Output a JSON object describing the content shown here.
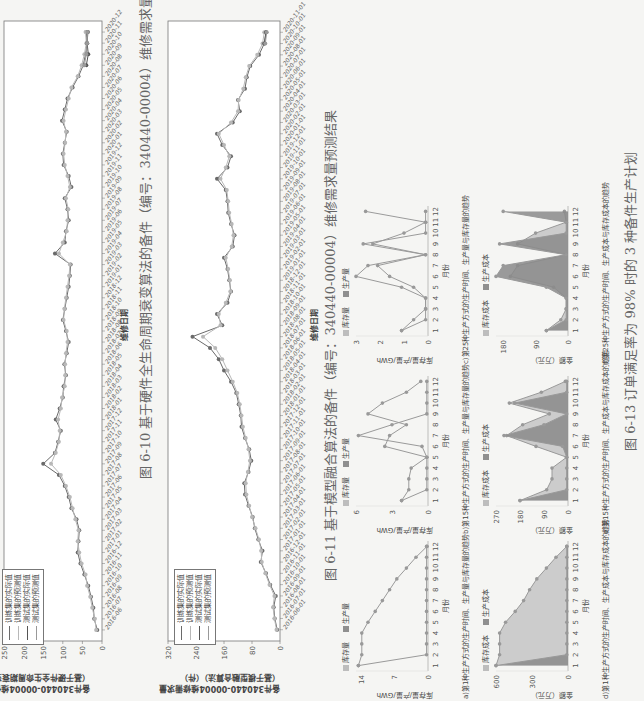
{
  "page": {
    "orientation": "rotated-90-ccw"
  },
  "figure_6_10": {
    "caption": "图 6-10   基于硬件全生命周期衰变算法的备件（编号：340440-00004）维修需求量预测结果",
    "ylabel_line1": "备件340440-00004维修需求量",
    "ylabel_line2": "（基于硬件全生命周期衰变算法）",
    "xlabel": "维修日期",
    "legend": [
      "训练集的实际值",
      "训练集的预测值",
      "测试集的实际值",
      "测试集的预测值"
    ],
    "yticks": [
      "0",
      "50",
      "100",
      "150",
      "200",
      "250"
    ]
  },
  "figure_6_11": {
    "caption": "图 6-11   基于模型融合算法的备件（编号：340440-00004）维修需求量预测结果",
    "ylabel_line1": "备件340440-00004维修需求量",
    "ylabel_line2": "（基于模型融合算法）（件）",
    "xlabel": "维修日期",
    "legend": [
      "训练集的实际值",
      "训练集的预测值",
      "测试集的实际值",
      "测试集的预测值"
    ],
    "yticks": [
      "0",
      "80",
      "160",
      "240",
      "320"
    ]
  },
  "figure_6_13": {
    "caption": "图 6-13   订单满足率为 98% 时的 3 种备件生产计划",
    "panels": [
      {
        "id": "a",
        "caption": "a)第1种生产方式的生产时间、生产量与库存量的趋势",
        "ylabel": "库存量/产量/GWh",
        "legend": [
          "库存量",
          "生产量"
        ],
        "yticks": [
          "0",
          "7",
          "14"
        ],
        "xlabel": "月份"
      },
      {
        "id": "b",
        "caption": "b)第15种生产方式的生产时间、生产量与库存量的趋势",
        "ylabel": "库存量/产量/GWh",
        "legend": [
          "库存量",
          "生产量"
        ],
        "yticks": [
          "0",
          "3",
          "6"
        ],
        "xlabel": "月份"
      },
      {
        "id": "c",
        "caption": "c)第25种生产方式的生产时间、生产量与库存量的趋势",
        "ylabel": "库存量/产量/GWh",
        "legend": [
          "库存量",
          "生产量"
        ],
        "yticks": [
          "0",
          "1",
          "2",
          "3"
        ],
        "xlabel": "月份"
      },
      {
        "id": "d",
        "caption": "d)第1种生产方式的生产时间、生产成本与库存成本的趋势",
        "ylabel": "金额（万元）",
        "legend": [
          "库存成本",
          "生产成本"
        ],
        "yticks": [
          "0",
          "300",
          "600"
        ],
        "xlabel": "月份"
      },
      {
        "id": "e",
        "caption": "e)第15种生产方式的生产时间、生产成本与库存成本的趋势",
        "ylabel": "金额（万元）",
        "legend": [
          "库存成本",
          "生产成本"
        ],
        "yticks": [
          "0",
          "90",
          "180",
          "270"
        ],
        "xlabel": "月份"
      },
      {
        "id": "f",
        "caption": "f)第25种生产方式的生产时间、生产成本与库存成本的趋势",
        "ylabel": "金额（万元）",
        "legend": [
          "库存成本",
          "生产成本"
        ],
        "yticks": [
          "0",
          "90",
          "180"
        ],
        "xlabel": "月份"
      }
    ],
    "months": [
      "1",
      "2",
      "3",
      "4",
      "5",
      "6",
      "7",
      "8",
      "9",
      "10",
      "11",
      "12"
    ]
  },
  "chart_data": [
    {
      "type": "line",
      "title": "图 6-10 基于硬件全生命周期衰变算法的备件（编号：340440-00004）维修需求量预测结果",
      "xlabel": "维修日期",
      "ylabel": "备件340440-00004维修需求量（基于硬件全生命周期衰变算法）",
      "ylim": [
        0,
        250
      ],
      "x": [
        "2016-06",
        "2016-07",
        "2016-08",
        "2016-09",
        "2016-10",
        "2016-11",
        "2016-12",
        "2017-01",
        "2017-02",
        "2017-03",
        "2017-04",
        "2017-05",
        "2017-06",
        "2017-07",
        "2017-08",
        "2017-09",
        "2017-10",
        "2017-11",
        "2017-12",
        "2018-01",
        "2018-02",
        "2018-03",
        "2018-04",
        "2018-05",
        "2018-06",
        "2018-07",
        "2018-08",
        "2018-09",
        "2018-10",
        "2018-11",
        "2018-12",
        "2019-01",
        "2019-02",
        "2019-03",
        "2019-04",
        "2019-05",
        "2019-06",
        "2019-07",
        "2019-08",
        "2019-09",
        "2019-10",
        "2019-11",
        "2019-12",
        "2020-01",
        "2020-02",
        "2020-03",
        "2020-04",
        "2020-05",
        "2020-06",
        "2020-07",
        "2020-08",
        "2020-09",
        "2020-10",
        "2020-11",
        "2020-12"
      ],
      "series": [
        {
          "name": "训练集的实际值",
          "values": [
            12,
            20,
            22,
            28,
            35,
            45,
            55,
            62,
            60,
            58,
            65,
            78,
            85,
            95,
            110,
            150,
            120,
            112,
            105,
            118,
            108,
            100,
            98,
            92,
            96,
            90,
            85,
            92,
            100,
            95,
            90,
            85,
            82,
            80,
            120,
            95,
            92,
            85,
            88,
            95,
            78,
            85,
            98,
            100,
            95,
            90,
            102,
            95,
            88,
            75,
            60,
            48,
            42,
            38,
            40
          ]
        },
        {
          "name": "训练集的预测值",
          "values": [
            15,
            18,
            25,
            30,
            38,
            42,
            52,
            58,
            62,
            60,
            68,
            75,
            82,
            92,
            105,
            130,
            118,
            110,
            108,
            112,
            105,
            102,
            95,
            94,
            94,
            92,
            88,
            90,
            98,
            96,
            92,
            88,
            84,
            82,
            110,
            100,
            90,
            88,
            86,
            92,
            82,
            88,
            95,
            98,
            94,
            92,
            98,
            92,
            85,
            78,
            62,
            52,
            45,
            40,
            42
          ]
        },
        {
          "name": "测试集的实际值",
          "values": [
            null,
            null,
            null,
            null,
            null,
            null,
            null,
            null,
            null,
            null,
            null,
            null,
            null,
            null,
            null,
            null,
            null,
            null,
            null,
            null,
            null,
            null,
            null,
            null,
            null,
            null,
            null,
            null,
            null,
            null,
            null,
            null,
            null,
            null,
            null,
            null,
            null,
            null,
            null,
            null,
            null,
            null,
            null,
            null,
            null,
            null,
            null,
            null,
            null,
            null,
            null,
            40,
            35,
            38,
            36
          ]
        },
        {
          "name": "测试集的预测值",
          "values": [
            null,
            null,
            null,
            null,
            null,
            null,
            null,
            null,
            null,
            null,
            null,
            null,
            null,
            null,
            null,
            null,
            null,
            null,
            null,
            null,
            null,
            null,
            null,
            null,
            null,
            null,
            null,
            null,
            null,
            null,
            null,
            null,
            null,
            null,
            null,
            null,
            null,
            null,
            null,
            null,
            null,
            null,
            null,
            null,
            null,
            null,
            null,
            null,
            null,
            null,
            null,
            45,
            40,
            38,
            37
          ]
        }
      ],
      "legend_position": "upper-left"
    },
    {
      "type": "line",
      "title": "图 6-11 基于模型融合算法的备件（编号：340440-00004）维修需求量预测结果",
      "xlabel": "维修日期",
      "ylabel": "备件340440-00004维修需求量（基于模型融合算法）（件）",
      "ylim": [
        0,
        320
      ],
      "x": [
        "2016-06-01",
        "2016-07-01",
        "2016-08-01",
        "2016-09-01",
        "2016-10-01",
        "2016-11-01",
        "2016-12-01",
        "2017-01-01",
        "2017-02-01",
        "2017-03-01",
        "2017-04-01",
        "2017-05-01",
        "2017-06-01",
        "2017-07-01",
        "2017-08-01",
        "2017-09-01",
        "2017-10-01",
        "2017-11-01",
        "2017-12-01",
        "2018-01-01",
        "2018-02-01",
        "2018-03-01",
        "2018-04-01",
        "2018-05-01",
        "2018-06-01",
        "2018-07-01",
        "2018-08-01",
        "2018-09-01",
        "2018-10-01",
        "2018-11-01",
        "2018-12-01",
        "2019-01-01",
        "2019-02-01",
        "2019-03-01",
        "2019-04-01",
        "2019-05-01",
        "2019-06-01",
        "2019-07-01",
        "2019-08-01",
        "2019-09-01",
        "2019-10-01",
        "2019-11-01",
        "2019-12-01",
        "2020-01-01",
        "2020-02-01",
        "2020-03-01",
        "2020-04-01",
        "2020-05-01",
        "2020-06-01",
        "2020-07-01",
        "2020-08-01",
        "2020-09-01",
        "2020-10-01",
        "2020-11-01"
      ],
      "series": [
        {
          "name": "训练集的实际值",
          "values": [
            8,
            15,
            18,
            12,
            28,
            40,
            55,
            50,
            62,
            72,
            78,
            90,
            100,
            102,
            90,
            82,
            88,
            100,
            110,
            112,
            118,
            125,
            140,
            160,
            175,
            200,
            250,
            165,
            180,
            150,
            140,
            145,
            150,
            160,
            135,
            130,
            140,
            148,
            150,
            155,
            180,
            150,
            140,
            165,
            180,
            135,
            115,
            120,
            100,
            95,
            85,
            60,
            45,
            40
          ]
        },
        {
          "name": "训练集的预测值",
          "values": [
            10,
            16,
            20,
            16,
            30,
            42,
            52,
            54,
            60,
            70,
            80,
            88,
            96,
            98,
            92,
            86,
            90,
            98,
            106,
            110,
            115,
            122,
            135,
            150,
            165,
            185,
            220,
            170,
            175,
            155,
            142,
            143,
            148,
            155,
            138,
            133,
            138,
            145,
            148,
            152,
            170,
            155,
            145,
            160,
            175,
            140,
            120,
            118,
            105,
            98,
            88,
            65,
            50,
            45
          ]
        },
        {
          "name": "测试集的实际值",
          "values": [
            null,
            null,
            null,
            null,
            null,
            null,
            null,
            null,
            null,
            null,
            null,
            null,
            null,
            null,
            null,
            null,
            null,
            null,
            null,
            null,
            null,
            null,
            null,
            null,
            null,
            null,
            null,
            null,
            null,
            null,
            null,
            null,
            null,
            null,
            null,
            null,
            null,
            null,
            null,
            null,
            null,
            null,
            null,
            null,
            null,
            null,
            null,
            null,
            null,
            null,
            null,
            null,
            45,
            40
          ]
        },
        {
          "name": "测试集的预测值",
          "values": [
            null,
            null,
            null,
            null,
            null,
            null,
            null,
            null,
            null,
            null,
            null,
            null,
            null,
            null,
            null,
            null,
            null,
            null,
            null,
            null,
            null,
            null,
            null,
            null,
            null,
            null,
            null,
            null,
            null,
            null,
            null,
            null,
            null,
            null,
            null,
            null,
            null,
            null,
            null,
            null,
            null,
            null,
            null,
            null,
            null,
            null,
            null,
            null,
            null,
            null,
            null,
            null,
            42,
            38
          ]
        }
      ],
      "legend_position": "upper-left"
    },
    {
      "type": "line",
      "title": "a)第1种生产方式的生产时间、生产量与库存量的趋势",
      "xlabel": "月份",
      "ylabel": "库存量/产量/GWh",
      "ylim": [
        0,
        15
      ],
      "x": [
        1,
        2,
        3,
        4,
        5,
        6,
        7,
        8,
        9,
        10,
        11,
        12
      ],
      "series": [
        {
          "name": "库存量",
          "values": [
            14.5,
            13.8,
            13.8,
            13.8,
            12.5,
            11,
            9.5,
            8,
            6.5,
            4.5,
            2.5,
            0.2
          ]
        },
        {
          "name": "生产量",
          "values": [
            14.5,
            0.3,
            0.3,
            0.3,
            0.3,
            0.3,
            0.3,
            0.3,
            0.3,
            0.3,
            0.3,
            0.3
          ]
        }
      ]
    },
    {
      "type": "line",
      "title": "b)第15种生产方式的生产时间、生产量与库存量的趋势",
      "xlabel": "月份",
      "ylabel": "库存量/产量/GWh",
      "ylim": [
        0,
        6
      ],
      "x": [
        1,
        2,
        3,
        4,
        5,
        6,
        7,
        8,
        9,
        10,
        11,
        12
      ],
      "series": [
        {
          "name": "库存量",
          "values": [
            2.2,
            1.6,
            1.6,
            1.4,
            0.1,
            3.6,
            3.2,
            1.8,
            5.0,
            3.8,
            1.8,
            0.6
          ]
        },
        {
          "name": "生产量",
          "values": [
            2.2,
            0.1,
            0.1,
            0.1,
            0.1,
            0.5,
            5.8,
            3.0,
            0.1,
            0.1,
            0.1,
            0.1
          ]
        }
      ]
    },
    {
      "type": "line",
      "title": "c)第25种生产方式的生产时间、生产量与库存量的趋势",
      "xlabel": "月份",
      "ylabel": "库存量/产量/GWh",
      "ylim": [
        0,
        3
      ],
      "x": [
        1,
        2,
        3,
        4,
        5,
        6,
        7,
        8,
        9,
        10,
        11,
        12
      ],
      "series": [
        {
          "name": "库存量",
          "values": [
            1.1,
            0.6,
            0.1,
            0.1,
            0.6,
            1.6,
            2.1,
            0.1,
            2.3,
            1.0,
            0.1,
            0.1
          ]
        },
        {
          "name": "生产量",
          "values": [
            1.1,
            0.1,
            0.1,
            0.1,
            1.1,
            3.0,
            2.5,
            0.1,
            2.7,
            0.1,
            0.1,
            2.6
          ]
        }
      ]
    },
    {
      "type": "area",
      "title": "d)第1种生产方式的生产时间、生产成本与库存成本的趋势",
      "xlabel": "月份",
      "ylabel": "金额（万元）",
      "ylim": [
        0,
        600
      ],
      "x": [
        1,
        2,
        3,
        4,
        5,
        6,
        7,
        8,
        9,
        10,
        11,
        12
      ],
      "series": [
        {
          "name": "库存成本",
          "values": [
            600,
            570,
            570,
            570,
            520,
            440,
            370,
            320,
            260,
            180,
            100,
            10
          ]
        },
        {
          "name": "生产成本",
          "values": [
            600,
            10,
            10,
            10,
            10,
            10,
            10,
            10,
            10,
            10,
            10,
            10
          ]
        }
      ]
    },
    {
      "type": "area",
      "title": "e)第15种生产方式的生产时间、生产成本与库存成本的趋势",
      "xlabel": "月份",
      "ylabel": "金额（万元）",
      "ylim": [
        0,
        270
      ],
      "x": [
        1,
        2,
        3,
        4,
        5,
        6,
        7,
        8,
        9,
        10,
        11,
        12
      ],
      "series": [
        {
          "name": "库存成本",
          "values": [
            180,
            80,
            60,
            60,
            5,
            120,
            230,
            170,
            70,
            220,
            100,
            10
          ]
        },
        {
          "name": "生产成本",
          "values": [
            180,
            5,
            5,
            5,
            5,
            20,
            240,
            90,
            5,
            200,
            5,
            5
          ]
        }
      ]
    },
    {
      "type": "area",
      "title": "f)第25种生产方式的生产时间、生产成本与库存成本的趋势",
      "xlabel": "月份",
      "ylabel": "金额（万元）",
      "ylim": [
        0,
        200
      ],
      "x": [
        1,
        2,
        3,
        4,
        5,
        6,
        7,
        8,
        9,
        10,
        11,
        12
      ],
      "series": [
        {
          "name": "库存成本",
          "values": [
            60,
            20,
            5,
            5,
            40,
            160,
            140,
            5,
            140,
            90,
            5,
            10
          ]
        },
        {
          "name": "生产成本",
          "values": [
            60,
            5,
            5,
            5,
            60,
            200,
            180,
            5,
            190,
            5,
            5,
            180
          ]
        }
      ]
    }
  ]
}
